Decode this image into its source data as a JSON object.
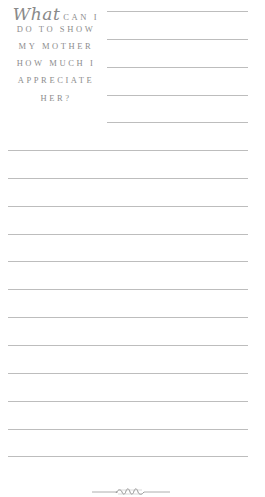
{
  "prompt": {
    "script_word": "What",
    "lines": [
      "CAN I",
      "DO TO SHOW",
      "MY MOTHER",
      "HOW MUCH I",
      "APPRECIATE",
      "HER?"
    ]
  },
  "writing_area": {
    "short_rule_count": 5,
    "full_rule_count": 12
  },
  "ornament": {
    "icon": "rope-flourish-icon"
  },
  "colors": {
    "text": "#8a8a8a",
    "rule": "#bdbdbd",
    "background": "#ffffff"
  }
}
